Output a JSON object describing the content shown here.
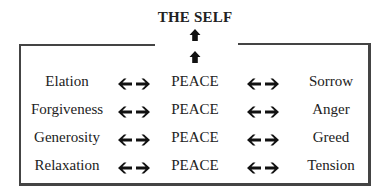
{
  "title": "THE SELF",
  "center_label": "PEACE",
  "rows": [
    {
      "left": "Elation",
      "center": "PEACE",
      "right": "Sorrow"
    },
    {
      "left": "Forgiveness",
      "center": "PEACE",
      "right": "Anger"
    },
    {
      "left": "Generosity",
      "center": "PEACE",
      "right": "Greed"
    },
    {
      "left": "Relaxation",
      "center": "PEACE",
      "right": "Tension"
    }
  ],
  "icons": {
    "up": "up-arrow-icon",
    "bidirectional": "left-right-arrow-icon"
  }
}
